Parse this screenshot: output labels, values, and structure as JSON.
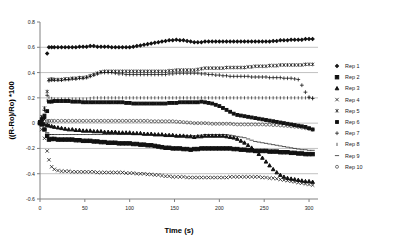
{
  "chart_data": {
    "type": "scatter",
    "title": "",
    "xlabel": "Time (s)",
    "ylabel": "((R-Ro)/Ro) *100",
    "xlim": [
      0,
      310
    ],
    "ylim": [
      -0.6,
      0.8
    ],
    "xticks": [
      0,
      50,
      100,
      150,
      200,
      250,
      300
    ],
    "xtick_labels": [
      "0",
      "50",
      "100",
      "150",
      "200",
      "250",
      "300"
    ],
    "yticks": [
      -0.6,
      -0.4,
      -0.2,
      0,
      0.2,
      0.4,
      0.6,
      0.8
    ],
    "ytick_labels": [
      "-0.6",
      "-0.4",
      "-0.2",
      "0",
      "0.2",
      "0.4",
      "0.6",
      "0.8"
    ],
    "grid": "horizontal",
    "legend_position": "right",
    "x": [
      0,
      2,
      5,
      8,
      10,
      13,
      16,
      20,
      24,
      28,
      32,
      36,
      40,
      44,
      48,
      52,
      56,
      60,
      64,
      68,
      72,
      76,
      80,
      84,
      88,
      92,
      96,
      100,
      104,
      108,
      112,
      116,
      120,
      124,
      128,
      132,
      136,
      140,
      144,
      148,
      152,
      156,
      160,
      164,
      168,
      172,
      176,
      180,
      184,
      188,
      192,
      196,
      200,
      204,
      208,
      212,
      216,
      220,
      224,
      228,
      232,
      236,
      240,
      244,
      248,
      252,
      256,
      260,
      264,
      268,
      272,
      276,
      280,
      284,
      288,
      292,
      296,
      300,
      304
    ],
    "series": [
      {
        "name": "Rep 1",
        "marker": "small-diamond",
        "values": [
          0.01,
          0.02,
          0.04,
          0.55,
          0.6,
          0.6,
          0.6,
          0.6,
          0.6,
          0.6,
          0.6,
          0.6,
          0.6,
          0.605,
          0.605,
          0.605,
          0.61,
          0.61,
          0.605,
          0.605,
          0.605,
          0.605,
          0.6,
          0.6,
          0.6,
          0.6,
          0.6,
          0.6,
          0.605,
          0.61,
          0.615,
          0.62,
          0.625,
          0.63,
          0.635,
          0.64,
          0.645,
          0.65,
          0.655,
          0.655,
          0.66,
          0.655,
          0.655,
          0.65,
          0.645,
          0.64,
          0.64,
          0.64,
          0.645,
          0.645,
          0.645,
          0.645,
          0.645,
          0.645,
          0.645,
          0.645,
          0.645,
          0.645,
          0.645,
          0.645,
          0.645,
          0.645,
          0.645,
          0.645,
          0.645,
          0.645,
          0.645,
          0.65,
          0.65,
          0.655,
          0.655,
          0.655,
          0.66,
          0.66,
          0.66,
          0.66,
          0.665,
          0.665,
          0.665
        ]
      },
      {
        "name": "Rep 2",
        "marker": "square",
        "values": [
          0.0,
          -0.01,
          -0.05,
          -0.1,
          -0.13,
          -0.125,
          -0.125,
          -0.13,
          -0.13,
          -0.13,
          -0.13,
          -0.13,
          -0.135,
          -0.135,
          -0.14,
          -0.14,
          -0.14,
          -0.145,
          -0.145,
          -0.15,
          -0.15,
          -0.155,
          -0.155,
          -0.155,
          -0.16,
          -0.16,
          -0.16,
          -0.16,
          -0.165,
          -0.165,
          -0.17,
          -0.17,
          -0.175,
          -0.175,
          -0.18,
          -0.185,
          -0.19,
          -0.195,
          -0.195,
          -0.2,
          -0.2,
          -0.2,
          -0.205,
          -0.205,
          -0.21,
          -0.205,
          -0.205,
          -0.2,
          -0.2,
          -0.2,
          -0.2,
          -0.2,
          -0.2,
          -0.2,
          -0.2,
          -0.2,
          -0.205,
          -0.205,
          -0.21,
          -0.21,
          -0.215,
          -0.215,
          -0.22,
          -0.22,
          -0.22,
          -0.22,
          -0.225,
          -0.225,
          -0.225,
          -0.23,
          -0.23,
          -0.23,
          -0.235,
          -0.235,
          -0.24,
          -0.24,
          -0.245,
          -0.245,
          -0.245
        ]
      },
      {
        "name": "Rep 3",
        "marker": "triangle",
        "values": [
          0.0,
          -0.005,
          -0.01,
          -0.015,
          -0.02,
          -0.025,
          -0.03,
          -0.035,
          -0.04,
          -0.045,
          -0.05,
          -0.05,
          -0.055,
          -0.055,
          -0.06,
          -0.06,
          -0.06,
          -0.065,
          -0.065,
          -0.065,
          -0.07,
          -0.07,
          -0.07,
          -0.07,
          -0.075,
          -0.075,
          -0.075,
          -0.075,
          -0.08,
          -0.08,
          -0.08,
          -0.085,
          -0.085,
          -0.085,
          -0.09,
          -0.09,
          -0.09,
          -0.095,
          -0.095,
          -0.095,
          -0.1,
          -0.1,
          -0.1,
          -0.105,
          -0.105,
          -0.11,
          -0.105,
          -0.105,
          -0.1,
          -0.1,
          -0.1,
          -0.1,
          -0.1,
          -0.1,
          -0.105,
          -0.11,
          -0.115,
          -0.125,
          -0.14,
          -0.155,
          -0.175,
          -0.195,
          -0.22,
          -0.245,
          -0.275,
          -0.305,
          -0.335,
          -0.365,
          -0.39,
          -0.41,
          -0.425,
          -0.435,
          -0.44,
          -0.445,
          -0.45,
          -0.455,
          -0.46,
          -0.46,
          -0.465
        ]
      },
      {
        "name": "Rep 4",
        "marker": "x",
        "values": [
          0.0,
          -0.05,
          -0.12,
          -0.22,
          -0.29,
          -0.345,
          -0.365,
          -0.375,
          -0.38,
          -0.38,
          -0.38,
          -0.385,
          -0.385,
          -0.385,
          -0.385,
          -0.385,
          -0.385,
          -0.385,
          -0.39,
          -0.39,
          -0.39,
          -0.39,
          -0.39,
          -0.39,
          -0.39,
          -0.39,
          -0.395,
          -0.395,
          -0.395,
          -0.4,
          -0.4,
          -0.4,
          -0.405,
          -0.405,
          -0.41,
          -0.41,
          -0.415,
          -0.42,
          -0.42,
          -0.425,
          -0.425,
          -0.425,
          -0.425,
          -0.43,
          -0.43,
          -0.43,
          -0.43,
          -0.43,
          -0.43,
          -0.43,
          -0.43,
          -0.43,
          -0.43,
          -0.43,
          -0.43,
          -0.425,
          -0.425,
          -0.425,
          -0.425,
          -0.425,
          -0.425,
          -0.425,
          -0.425,
          -0.425,
          -0.43,
          -0.43,
          -0.435,
          -0.435,
          -0.44,
          -0.445,
          -0.45,
          -0.455,
          -0.46,
          -0.465,
          -0.47,
          -0.475,
          -0.48,
          -0.485,
          -0.49
        ]
      },
      {
        "name": "Rep 5",
        "marker": "asterisk",
        "values": [
          0.01,
          0.05,
          0.12,
          0.25,
          0.345,
          0.35,
          0.345,
          0.345,
          0.345,
          0.35,
          0.35,
          0.355,
          0.355,
          0.36,
          0.36,
          0.365,
          0.375,
          0.385,
          0.395,
          0.405,
          0.41,
          0.41,
          0.41,
          0.41,
          0.41,
          0.41,
          0.41,
          0.41,
          0.41,
          0.41,
          0.41,
          0.41,
          0.41,
          0.41,
          0.41,
          0.41,
          0.41,
          0.41,
          0.415,
          0.415,
          0.42,
          0.42,
          0.42,
          0.42,
          0.42,
          0.42,
          0.425,
          0.43,
          0.435,
          0.435,
          0.435,
          0.435,
          0.435,
          0.435,
          0.44,
          0.44,
          0.44,
          0.44,
          0.44,
          0.44,
          0.445,
          0.445,
          0.45,
          0.45,
          0.45,
          0.45,
          0.455,
          0.455,
          0.455,
          0.46,
          0.46,
          0.46,
          0.46,
          0.46,
          0.46,
          0.46,
          0.465,
          0.465,
          0.465
        ]
      },
      {
        "name": "Rep 6",
        "marker": "small-square",
        "values": [
          0.01,
          0.03,
          0.06,
          0.095,
          0.17,
          0.17,
          0.175,
          0.175,
          0.175,
          0.175,
          0.175,
          0.17,
          0.17,
          0.17,
          0.165,
          0.165,
          0.165,
          0.165,
          0.165,
          0.165,
          0.165,
          0.165,
          0.165,
          0.165,
          0.165,
          0.165,
          0.16,
          0.16,
          0.155,
          0.155,
          0.155,
          0.155,
          0.155,
          0.155,
          0.155,
          0.155,
          0.155,
          0.155,
          0.16,
          0.16,
          0.16,
          0.165,
          0.165,
          0.165,
          0.165,
          0.165,
          0.165,
          0.17,
          0.165,
          0.16,
          0.155,
          0.145,
          0.135,
          0.12,
          0.105,
          0.09,
          0.075,
          0.065,
          0.06,
          0.055,
          0.05,
          0.045,
          0.04,
          0.035,
          0.03,
          0.025,
          0.02,
          0.015,
          0.01,
          0.005,
          0.0,
          -0.005,
          -0.01,
          -0.015,
          -0.02,
          -0.025,
          -0.03,
          -0.04,
          -0.05
        ]
      },
      {
        "name": "Rep 7",
        "marker": "plus",
        "values": [
          0.01,
          0.04,
          0.1,
          0.22,
          0.335,
          0.34,
          0.34,
          0.34,
          0.34,
          0.345,
          0.345,
          0.35,
          0.35,
          0.355,
          0.355,
          0.36,
          0.37,
          0.38,
          0.39,
          0.4,
          0.4,
          0.4,
          0.4,
          0.395,
          0.39,
          0.39,
          0.385,
          0.385,
          0.385,
          0.385,
          0.385,
          0.385,
          0.385,
          0.385,
          0.385,
          0.385,
          0.385,
          0.385,
          0.39,
          0.39,
          0.395,
          0.395,
          0.395,
          0.395,
          0.395,
          0.395,
          0.395,
          0.39,
          0.39,
          0.385,
          0.385,
          0.38,
          0.38,
          0.375,
          0.375,
          0.37,
          0.37,
          0.37,
          0.37,
          0.37,
          0.37,
          0.365,
          0.365,
          0.365,
          0.365,
          0.365,
          0.36,
          0.36,
          0.36,
          0.36,
          0.355,
          0.355,
          0.355,
          0.35,
          0.345,
          0.3,
          0.245,
          0.205,
          0.195
        ]
      },
      {
        "name": "Rep 8",
        "marker": "tick",
        "values": [
          0.01,
          0.05,
          0.11,
          0.18,
          0.205,
          0.195,
          0.19,
          0.19,
          0.19,
          0.19,
          0.19,
          0.19,
          0.19,
          0.19,
          0.19,
          0.19,
          0.195,
          0.2,
          0.2,
          0.2,
          0.2,
          0.2,
          0.2,
          0.2,
          0.2,
          0.2,
          0.2,
          0.2,
          0.2,
          0.2,
          0.2,
          0.2,
          0.2,
          0.2,
          0.2,
          0.2,
          0.2,
          0.2,
          0.2,
          0.2,
          0.2,
          0.2,
          0.2,
          0.2,
          0.2,
          0.2,
          0.2,
          0.2,
          0.2,
          0.2,
          0.2,
          0.2,
          0.2,
          0.2,
          0.2,
          0.2,
          0.2,
          0.2,
          0.2,
          0.2,
          0.2,
          0.2,
          0.2,
          0.2,
          0.2,
          0.2,
          0.2,
          0.2,
          0.2,
          0.2,
          0.2,
          0.2,
          0.2,
          0.2,
          0.2,
          0.2,
          0.2,
          0.2,
          0.2
        ]
      },
      {
        "name": "Rep 9",
        "marker": "dash",
        "values": [
          0.0,
          -0.02,
          -0.05,
          -0.075,
          -0.09,
          -0.09,
          -0.09,
          -0.09,
          -0.09,
          -0.09,
          -0.09,
          -0.09,
          -0.09,
          -0.09,
          -0.09,
          -0.09,
          -0.09,
          -0.09,
          -0.09,
          -0.09,
          -0.09,
          -0.09,
          -0.09,
          -0.09,
          -0.09,
          -0.09,
          -0.09,
          -0.09,
          -0.09,
          -0.09,
          -0.09,
          -0.09,
          -0.09,
          -0.09,
          -0.09,
          -0.095,
          -0.095,
          -0.095,
          -0.095,
          -0.1,
          -0.1,
          -0.1,
          -0.1,
          -0.1,
          -0.1,
          -0.1,
          -0.1,
          -0.095,
          -0.09,
          -0.09,
          -0.09,
          -0.09,
          -0.09,
          -0.09,
          -0.09,
          -0.095,
          -0.1,
          -0.105,
          -0.11,
          -0.115,
          -0.125,
          -0.135,
          -0.145,
          -0.15,
          -0.155,
          -0.16,
          -0.165,
          -0.17,
          -0.175,
          -0.18,
          -0.185,
          -0.19,
          -0.195,
          -0.2,
          -0.205,
          -0.21,
          -0.21,
          -0.215,
          -0.215
        ]
      },
      {
        "name": "Rep 10",
        "marker": "open-circle",
        "values": [
          0.01,
          0.012,
          0.014,
          0.016,
          0.018,
          0.018,
          0.018,
          0.018,
          0.018,
          0.018,
          0.018,
          0.018,
          0.018,
          0.018,
          0.018,
          0.018,
          0.018,
          0.018,
          0.018,
          0.018,
          0.018,
          0.018,
          0.018,
          0.018,
          0.018,
          0.018,
          0.018,
          0.018,
          0.018,
          0.018,
          0.018,
          0.018,
          0.018,
          0.015,
          0.015,
          0.015,
          0.015,
          0.015,
          0.015,
          0.015,
          0.012,
          0.01,
          0.008,
          0.005,
          0.003,
          0.0,
          0.0,
          0.0,
          0.0,
          -0.002,
          -0.005,
          -0.005,
          -0.005,
          -0.005,
          -0.005,
          -0.005,
          -0.008,
          -0.01,
          -0.01,
          -0.01,
          -0.01,
          -0.01,
          -0.01,
          -0.01,
          -0.01,
          -0.012,
          -0.012,
          -0.015,
          -0.015,
          -0.018,
          -0.02,
          -0.022,
          -0.025,
          -0.028,
          -0.03,
          -0.035,
          -0.04,
          -0.045,
          -0.05
        ]
      }
    ]
  },
  "legend": {
    "items": [
      {
        "label": "Rep 1"
      },
      {
        "label": "Rep 2"
      },
      {
        "label": "Rep 3"
      },
      {
        "label": "Rep 4"
      },
      {
        "label": "Rep 5"
      },
      {
        "label": "Rep 6"
      },
      {
        "label": "Rep 7"
      },
      {
        "label": "Rep 8"
      },
      {
        "label": "Rep 9"
      },
      {
        "label": "Rep 10"
      }
    ]
  }
}
